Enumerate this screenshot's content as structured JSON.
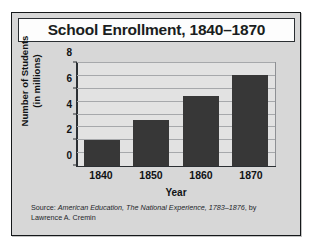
{
  "chart_data": {
    "type": "bar",
    "title": "School Enrollment, 1840–1870",
    "categories": [
      "1840",
      "1850",
      "1860",
      "1870"
    ],
    "values": [
      2.0,
      3.6,
      5.4,
      7.1
    ],
    "xlabel": "Year",
    "ylabel": "Number of Students (in millions)",
    "ylabel_line1": "Number of Students",
    "ylabel_line2": "(in millions)",
    "ylim": [
      0,
      8
    ],
    "ytick_labels": [
      "0",
      "2",
      "4",
      "6",
      "8"
    ],
    "ytick_values": [
      0,
      2,
      4,
      6,
      8
    ],
    "gridline_values": [
      1,
      2,
      3,
      4,
      5,
      6,
      7,
      8
    ],
    "grid": true,
    "legend": false,
    "bar_color": "#373737",
    "plot_background": "#e2e2e2",
    "figure_background": "#d7d7d7",
    "title_background": "#fdfdfd",
    "axis_color": "#2b2f33",
    "grid_color": "#a6a8ab"
  },
  "source": {
    "line1_prefix": "Source: ",
    "line1_italic": "American Education, The National Experience, 1783–1876",
    "line1_suffix": ",",
    "line2": "by Lawrence A. Cremin"
  }
}
